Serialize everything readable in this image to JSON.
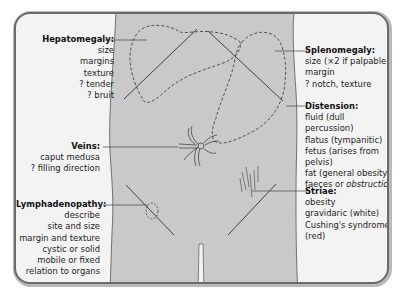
{
  "labels": {
    "hepatomegaly": {
      "title": "Hepatomegaly:",
      "items": [
        "size",
        "margins",
        "texture",
        "? tender",
        "? bruit"
      ]
    },
    "veins": {
      "title": "Veins:",
      "items": [
        "caput medusa",
        "? filling direction"
      ]
    },
    "lymphadenopathy": {
      "title": "Lymphadenopathy:",
      "items": [
        "describe",
        "site and size",
        "margin and texture",
        "cystic or solid",
        "mobile or fixed",
        "relation to organs"
      ]
    },
    "splenomegaly": {
      "title": "Splenomegaly:",
      "items": [
        "size (×2 if palpable)",
        "margin",
        "? notch, texture"
      ]
    },
    "distension": {
      "title": "Distension:",
      "items": [
        "fluid (dull percussion)",
        "flatus (tympanitic)",
        "fetus (arises from",
        "pelvis)",
        "fat (general obesity)",
        "faeces or"
      ],
      "last_item_emphasis": "obstruction"
    },
    "striae": {
      "title": "Striae:",
      "items": [
        "obesity",
        "gravidaric (white)",
        "Cushing's syndrome",
        "(red)"
      ]
    }
  },
  "colors": {
    "torso_fill": "#c9c9c9",
    "frame_bg": "#f3f3f3",
    "frame_border": "#6b6b6b",
    "line": "#333333"
  }
}
